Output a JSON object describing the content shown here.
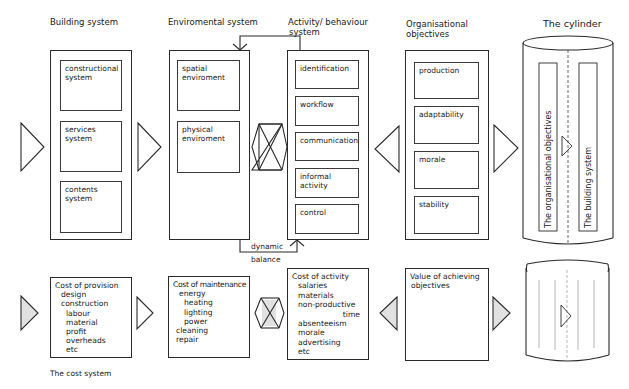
{
  "columns": {
    "building": {
      "title": "Building system",
      "items": [
        {
          "label": "constructional system"
        },
        {
          "label": "services system"
        },
        {
          "label": "contents system"
        }
      ]
    },
    "environmental": {
      "title": "Enviromental system",
      "items": [
        {
          "label": "spatial enviroment"
        },
        {
          "label": "physical enviroment"
        }
      ]
    },
    "activity": {
      "title_line1": "Activity/ behaviour",
      "title_line2": "system",
      "items": [
        {
          "label": "identification"
        },
        {
          "label": "workflow"
        },
        {
          "label": "communication"
        },
        {
          "label": "informal activity"
        },
        {
          "label": "control"
        }
      ]
    },
    "organisational": {
      "title_line1": "Organisational",
      "title_line2": "objectives",
      "items": [
        {
          "label": "production"
        },
        {
          "label": "adaptability"
        },
        {
          "label": "morale"
        },
        {
          "label": "stability"
        }
      ]
    },
    "cylinder": {
      "title": "The cylinder",
      "left_strip": "The organisational objectives",
      "right_strip": "The building system"
    }
  },
  "feedback": {
    "label_line1": "dynamic",
    "label_line2": "balance"
  },
  "cost_system": {
    "caption": "The cost system",
    "provision": {
      "heading": "Cost of provision",
      "lines": [
        "design",
        "construction",
        "labour",
        "material",
        "profit",
        "overheads",
        "etc"
      ]
    },
    "maintenance": {
      "heading": "Cost of maintenance",
      "lines": [
        "energy",
        "heating",
        "lighting",
        "power",
        "cleaning",
        "repair"
      ]
    },
    "activity": {
      "heading": "Cost of activity",
      "lines": [
        "salaries",
        "materials",
        "non-productive",
        "time",
        "absenteeism",
        "morale",
        "advertising",
        "etc"
      ]
    },
    "value": {
      "heading": "Value of achieving",
      "heading2": "objectives"
    }
  },
  "colors": {
    "line": "#2a2a2a",
    "background": "#ffffff",
    "hatch": "#9a9a9a"
  }
}
